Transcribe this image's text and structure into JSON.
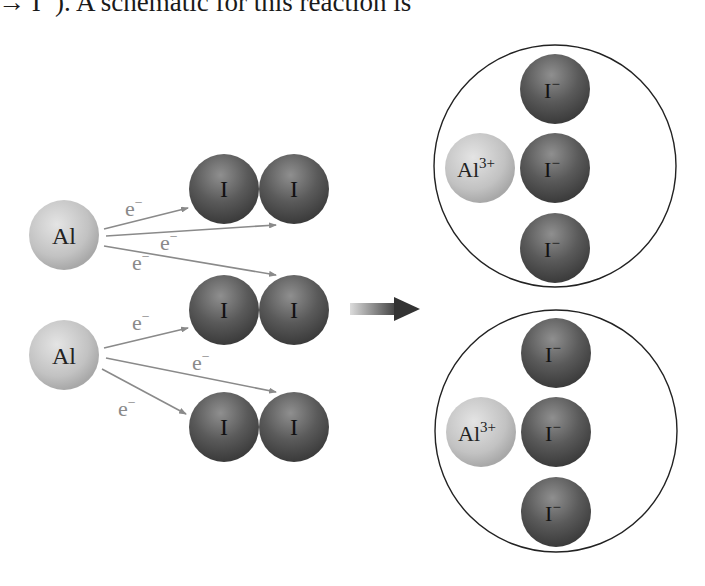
{
  "caption": "→ I⁻). A schematic for this reaction is",
  "diagram": {
    "reactants": {
      "al_atoms": [
        {
          "label": "Al"
        },
        {
          "label": "Al"
        }
      ],
      "iodine_molecules": [
        {
          "atoms": [
            "I",
            "I"
          ]
        },
        {
          "atoms": [
            "I",
            "I"
          ]
        },
        {
          "atoms": [
            "I",
            "I"
          ]
        }
      ],
      "electron_label": "e⁻",
      "electron_symbol": "e",
      "electron_charge": "−"
    },
    "reaction_arrow": "right-arrow",
    "products": {
      "units": [
        {
          "cation": {
            "symbol": "Al",
            "charge": "3+"
          },
          "anions": [
            {
              "symbol": "I",
              "charge": "−"
            },
            {
              "symbol": "I",
              "charge": "−"
            },
            {
              "symbol": "I",
              "charge": "−"
            }
          ]
        },
        {
          "cation": {
            "symbol": "Al",
            "charge": "3+"
          },
          "anions": [
            {
              "symbol": "I",
              "charge": "−"
            },
            {
              "symbol": "I",
              "charge": "−"
            },
            {
              "symbol": "I",
              "charge": "−"
            }
          ]
        }
      ]
    },
    "colors": {
      "al_sphere": "#c4c4c4",
      "i_sphere": "#555555",
      "arrow_line": "#8a8a8a",
      "electron_text": "#8a8a8a",
      "outline": "#222222"
    }
  }
}
